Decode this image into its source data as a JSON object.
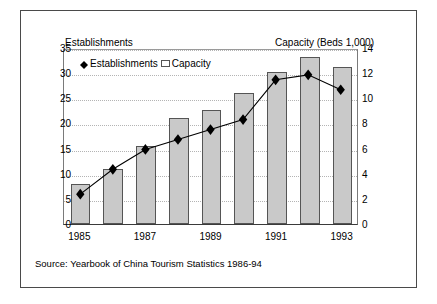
{
  "chart_data": {
    "type": "bar",
    "title": "",
    "categories": [
      "1985",
      "1986",
      "1987",
      "1988",
      "1989",
      "1990",
      "1991",
      "1992",
      "1993"
    ],
    "tick_categories": [
      "1985",
      "",
      "1987",
      "",
      "1989",
      "",
      "1991",
      "",
      "1993"
    ],
    "series": [
      {
        "name": "Capacity",
        "type": "bar",
        "axis": "right",
        "values": [
          3.2,
          4.4,
          6.2,
          8.4,
          9.1,
          10.4,
          12.1,
          13.3,
          12.5
        ]
      },
      {
        "name": "Establishments",
        "type": "line",
        "axis": "left",
        "values": [
          6,
          11,
          15,
          17,
          19,
          21,
          29,
          30,
          27
        ]
      }
    ],
    "xlabel": "",
    "ylabel": "Establishments",
    "y2label": "Capacity (Beds 1,000)",
    "ylim": [
      0,
      35
    ],
    "y2lim": [
      0,
      14
    ],
    "yticks": [
      0,
      5,
      10,
      15,
      20,
      25,
      30,
      35
    ],
    "y2ticks": [
      0,
      2,
      4,
      6,
      8,
      10,
      12,
      14
    ],
    "grid": true,
    "legend_position": "top-left",
    "source": "Source: Yearbook of China Tourism Statistics 1986-94",
    "colors": {
      "bar_fill": "#c9c9c9",
      "bar_border": "#555555",
      "line": "#000000",
      "marker": "#000000",
      "grid": "#b4b4b4",
      "frame": "#4a4a4a"
    }
  },
  "legend": {
    "establishments_label": "Establishments",
    "capacity_label": "Capacity"
  },
  "axes": {
    "left_title": "Establishments",
    "right_title": "Capacity (Beds 1,000)"
  }
}
